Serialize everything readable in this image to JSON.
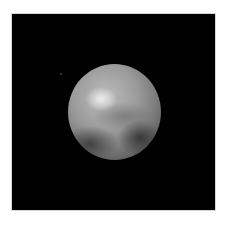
{
  "image": {
    "subject": "Pluto (globe on black background)",
    "background_color": "#000000",
    "page_color": "#ffffff",
    "planet_tone": "grayscale"
  }
}
